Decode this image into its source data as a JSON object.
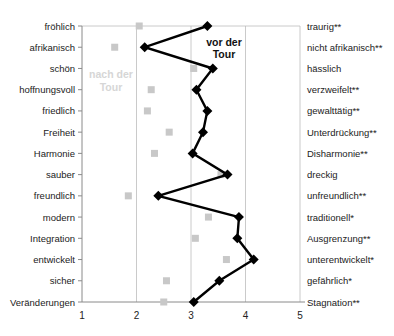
{
  "chart_data": {
    "type": "line",
    "orientation": "horizontal-profile",
    "title": "",
    "xlabel": "",
    "ylabel": "",
    "xlim": [
      1,
      5
    ],
    "x_ticks": [
      "1",
      "2",
      "3",
      "4",
      "5"
    ],
    "grid": "vertical",
    "categories_left": [
      "fröhlich",
      "afrikanisch",
      "schön",
      "hoffnungsvoll",
      "friedlich",
      "Freiheit",
      "Harmonie",
      "sauber",
      "freundlich",
      "modern",
      "Integration",
      "entwickelt",
      "sicher",
      "Veränderungen"
    ],
    "categories_right": [
      "traurig**",
      "nicht afrikanisch**",
      "hässlich",
      "verzweifelt**",
      "gewalttätig**",
      "Unterdrückung**",
      "Disharmonie**",
      "dreckig",
      "unfreundlich**",
      "traditionell*",
      "Ausgrenzung**",
      "unterentwickelt*",
      "gefährlich*",
      "Stagnation**"
    ],
    "series": [
      {
        "name": "vor der Tour",
        "style": "black line with diamond markers",
        "color": "#000000",
        "values": [
          3.3,
          2.15,
          3.4,
          3.1,
          3.3,
          3.22,
          3.03,
          3.67,
          2.4,
          3.88,
          3.85,
          4.15,
          3.52,
          3.05
        ]
      },
      {
        "name": "nach der Tour",
        "style": "light gray square markers, no line",
        "color": "#c8c8c8",
        "values": [
          2.05,
          1.6,
          3.05,
          2.27,
          2.2,
          2.6,
          2.33,
          3.55,
          1.85,
          3.32,
          3.08,
          3.65,
          2.55,
          2.5
        ]
      }
    ],
    "annotations": [
      {
        "text_line1": "vor der",
        "text_line2": "Tour",
        "series": "vor der Tour"
      },
      {
        "text_line1": "nach der",
        "text_line2": "Tour",
        "series": "nach der Tour"
      }
    ]
  }
}
